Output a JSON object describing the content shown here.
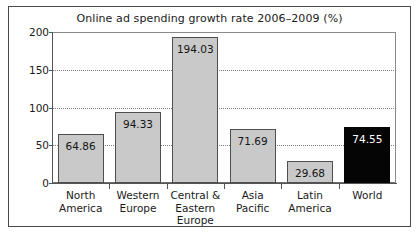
{
  "chart_data": {
    "type": "bar",
    "title": "Online ad spending growth rate 2006–2009 (%)",
    "xlabel": "",
    "ylabel": "",
    "ylim": [
      0,
      200
    ],
    "yticks": [
      "0",
      "50",
      "100",
      "150",
      "200"
    ],
    "grid": "horizontal-dotted",
    "legend": "none",
    "categories": [
      "North America",
      "Western Europe",
      "Central & Eastern Europe",
      "Asia Pacific",
      "Latin America",
      "World"
    ],
    "category_lines": [
      [
        "North",
        "America"
      ],
      [
        "Western",
        "Europe"
      ],
      [
        "Central &",
        "Eastern",
        "Europe"
      ],
      [
        "Asia",
        "Pacific"
      ],
      [
        "Latin",
        "America"
      ],
      [
        "World"
      ]
    ],
    "values": [
      64.86,
      94.33,
      194.03,
      71.69,
      29.68,
      74.55
    ],
    "value_labels": [
      "64.86",
      "94.33",
      "194.03",
      "71.69",
      "29.68",
      "74.55"
    ],
    "bar_colors": [
      "#c9c9c9",
      "#c9c9c9",
      "#c9c9c9",
      "#c9c9c9",
      "#c9c9c9",
      "#050505"
    ],
    "bar_label_colors": [
      "#141414",
      "#141414",
      "#141414",
      "#141414",
      "#141414",
      "#ffffff"
    ]
  },
  "figure": {
    "border_color": "#4a4a4a",
    "background": "#ffffff",
    "axis_color": "#555555",
    "gridline_color": "#7c7c7c"
  }
}
